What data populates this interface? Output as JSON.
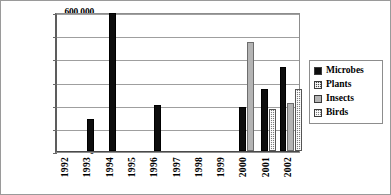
{
  "chart_data": {
    "type": "bar",
    "title": "",
    "xlabel": "",
    "ylabel": "",
    "categories": [
      "1992",
      "1993",
      "1994",
      "1995",
      "1996",
      "1997",
      "1998",
      "1999",
      "2000",
      "2001",
      "2002"
    ],
    "ylim": [
      0,
      600000
    ],
    "ytick_values": [
      0,
      100000,
      200000,
      300000,
      400000,
      500000,
      600000
    ],
    "ytick_labels": [
      "0",
      "100,000",
      "200,000",
      "300,000",
      "400,000",
      "500,000",
      "600,000"
    ],
    "grid": true,
    "legend_position": "right",
    "series": [
      {
        "name": "Microbes",
        "pattern": "solid-black",
        "color": "#0d0d0d",
        "values": [
          0,
          137000,
          597000,
          0,
          197000,
          0,
          0,
          0,
          190000,
          268000,
          362000
        ]
      },
      {
        "name": "Plants",
        "pattern": "dark-checker",
        "color": "#4a4a4a",
        "values": [
          0,
          0,
          0,
          0,
          0,
          0,
          0,
          0,
          0,
          0,
          0
        ]
      },
      {
        "name": "Insects",
        "pattern": "solid-gray",
        "color": "#b4b4b4",
        "values": [
          0,
          0,
          0,
          0,
          0,
          0,
          0,
          0,
          470000,
          0,
          207000
        ]
      },
      {
        "name": "Birds",
        "pattern": "light-checker",
        "color": "#7d7d7d",
        "values": [
          0,
          0,
          0,
          0,
          0,
          0,
          0,
          0,
          0,
          180000,
          267000
        ]
      }
    ]
  }
}
